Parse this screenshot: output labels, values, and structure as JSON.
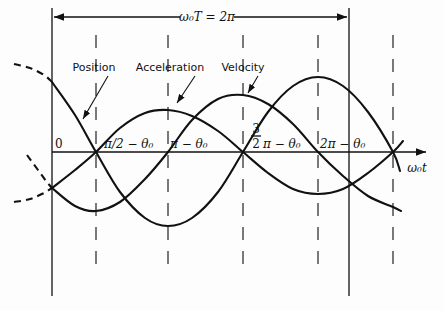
{
  "figure": {
    "period_label": "ω₀T = 2π",
    "axis_label": "ω₀t",
    "curve_labels": {
      "position": "Position",
      "acceleration": "Acceleration",
      "velocity": "Velocity"
    },
    "tick_labels": {
      "origin": "0",
      "t1": "π/2 − θ₀",
      "t2": "π − θ₀",
      "t3_frac_num": "3",
      "t3_frac_den": "2",
      "t3_rest": "π − θ₀",
      "t4": "2π − θ₀"
    },
    "colors": {
      "ink": "#111111",
      "background": "#fdfdfd"
    }
  },
  "geometry": {
    "axis_y": 152,
    "period_bounds_x": [
      52,
      349
    ],
    "dashed_x": [
      96,
      168,
      243,
      318,
      393
    ]
  },
  "curves": {
    "position": {
      "extension": [
        [
          14,
          64
        ],
        [
          30,
          68
        ],
        [
          44,
          75
        ],
        [
          52,
          82
        ]
      ],
      "main": [
        [
          52,
          82
        ],
        [
          75,
          115
        ],
        [
          96,
          152
        ],
        [
          120,
          192
        ],
        [
          145,
          218
        ],
        [
          168,
          226
        ],
        [
          192,
          218
        ],
        [
          218,
          192
        ],
        [
          243,
          152
        ],
        [
          268,
          112
        ],
        [
          293,
          86
        ],
        [
          318,
          77
        ],
        [
          343,
          86
        ],
        [
          368,
          112
        ],
        [
          393,
          152
        ],
        [
          400,
          171
        ]
      ]
    },
    "acceleration": {
      "extension": [
        [
          14,
          202
        ],
        [
          30,
          199
        ],
        [
          44,
          193
        ],
        [
          52,
          188
        ]
      ],
      "main": [
        [
          52,
          188
        ],
        [
          75,
          170
        ],
        [
          96,
          152
        ],
        [
          120,
          128
        ],
        [
          145,
          113
        ],
        [
          168,
          110
        ],
        [
          192,
          116
        ],
        [
          218,
          131
        ],
        [
          243,
          152
        ],
        [
          268,
          173
        ],
        [
          293,
          189
        ],
        [
          318,
          194
        ],
        [
          343,
          189
        ],
        [
          368,
          173
        ],
        [
          393,
          152
        ],
        [
          403,
          141
        ]
      ]
    },
    "velocity": {
      "extension": [
        [
          27,
          155
        ],
        [
          38,
          170
        ],
        [
          46,
          181
        ],
        [
          52,
          188
        ]
      ],
      "main": [
        [
          52,
          188
        ],
        [
          75,
          206
        ],
        [
          96,
          211
        ],
        [
          120,
          202
        ],
        [
          145,
          179
        ],
        [
          168,
          152
        ],
        [
          192,
          120
        ],
        [
          218,
          99
        ],
        [
          243,
          95
        ],
        [
          268,
          104
        ],
        [
          293,
          124
        ],
        [
          318,
          152
        ],
        [
          343,
          176
        ],
        [
          368,
          196
        ],
        [
          393,
          207
        ],
        [
          401,
          211
        ]
      ]
    }
  }
}
